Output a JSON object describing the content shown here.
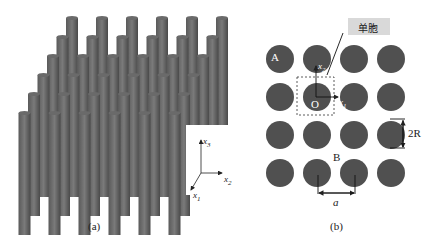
{
  "panel_a": {
    "caption": "(a)",
    "description": "3D array of vertical cylindrical fibers in square arrangement",
    "axes": {
      "x1": "x",
      "x1_sub": "1",
      "x2": "x",
      "x2_sub": "2",
      "x3": "x",
      "x3_sub": "3"
    }
  },
  "panel_b": {
    "caption": "(b)",
    "callout_label": "单胞",
    "point_a": "A",
    "point_b": "B",
    "origin": "O",
    "axis_x1": "x",
    "axis_x1_sub": "1",
    "axis_x2": "x",
    "axis_x2_sub": "2",
    "dim_diameter": "2R",
    "dim_spacing": "a",
    "grid": {
      "rows": 4,
      "cols": 4
    },
    "colors": {
      "fiber": "#505050",
      "callout_bg": "#d9d9d9"
    }
  }
}
